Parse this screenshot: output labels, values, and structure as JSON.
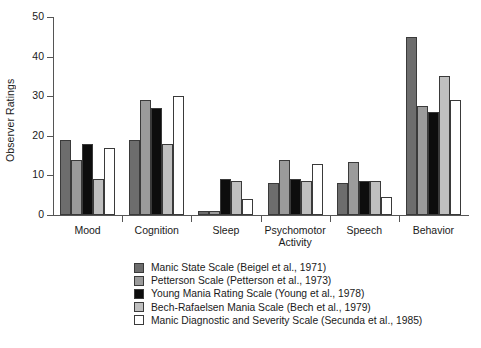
{
  "chart_data": {
    "type": "bar",
    "title": "",
    "xlabel": "",
    "ylabel": "Observer Ratings",
    "ylim": [
      0,
      50
    ],
    "yticks": [
      0,
      10,
      20,
      30,
      40,
      50
    ],
    "ytick_labels": [
      "0",
      "10",
      "20",
      "30",
      "40",
      "50"
    ],
    "grid": false,
    "legend_position": "below",
    "categories": [
      "Mood",
      "Cognition",
      "Sleep",
      "Psychomotor\nActivity",
      "Speech",
      "Behavior"
    ],
    "series": [
      {
        "name": "Manic State Scale (Beigel et al., 1971)",
        "color": "#6d6d6d",
        "values": [
          19,
          19,
          1,
          8,
          8,
          45
        ]
      },
      {
        "name": "Petterson Scale (Petterson et al., 1973)",
        "color": "#9b9b9b",
        "values": [
          14,
          29,
          1,
          14,
          13.5,
          27.5
        ]
      },
      {
        "name": "Young Mania Rating Scale (Young et al., 1978)",
        "color": "#0d0d0d",
        "values": [
          18,
          27,
          9,
          9,
          8.7,
          26
        ]
      },
      {
        "name": "Bech-Rafaelsen Mania Scale (Bech et al., 1979)",
        "color": "#bfbfbf",
        "values": [
          9,
          18,
          8.7,
          8.7,
          8.7,
          35
        ]
      },
      {
        "name": "Manic Diagnostic and Severity Scale (Secunda et al., 1985)",
        "color": "#ffffff",
        "values": [
          17,
          30,
          4,
          13,
          4.5,
          29
        ]
      }
    ]
  },
  "legend": {
    "items": [
      {
        "label": "Manic State Scale (Beigel et al., 1971)",
        "color": "#6d6d6d"
      },
      {
        "label": "Petterson Scale (Petterson et al., 1973)",
        "color": "#9b9b9b"
      },
      {
        "label": "Young Mania Rating Scale (Young et al., 1978)",
        "color": "#0d0d0d"
      },
      {
        "label": "Bech-Rafaelsen Mania Scale (Bech et al., 1979)",
        "color": "#bfbfbf"
      },
      {
        "label": "Manic Diagnostic and Severity Scale (Secunda et al., 1985)",
        "color": "#ffffff"
      }
    ]
  },
  "axis_color": "#555555",
  "bar_border_color": "#3a3a3a"
}
